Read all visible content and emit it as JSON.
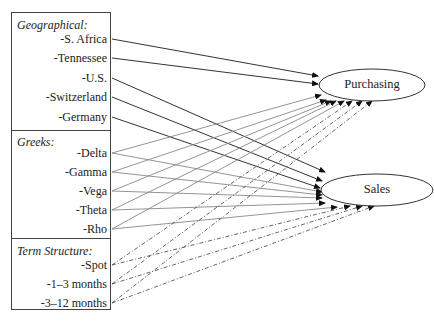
{
  "groups": [
    {
      "title": "Geographical:",
      "items": [
        "-S. Africa",
        "-Tennessee",
        "-U.S.",
        "-Switzerland",
        "-Germany"
      ]
    },
    {
      "title": "Greeks:",
      "items": [
        "-Delta",
        "-Gamma",
        "-Vega",
        "-Theta",
        "-Rho"
      ]
    },
    {
      "title": "Term Structure:",
      "items": [
        "-Spot",
        "-1–3 months",
        "-3–12 months"
      ]
    }
  ],
  "targets": [
    {
      "label": "Purchasing"
    },
    {
      "label": "Sales"
    }
  ],
  "colors": {
    "border": "#444444",
    "geo_line": "#333333",
    "greek_line": "#888888",
    "term_line": "#555555"
  }
}
